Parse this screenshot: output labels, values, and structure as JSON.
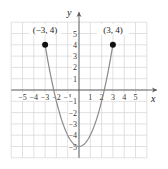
{
  "chart_data": {
    "type": "line",
    "title": "",
    "xlabel": "x",
    "ylabel": "y",
    "xlim": [
      -6,
      6
    ],
    "ylim": [
      -6,
      6
    ],
    "grid": true,
    "x_ticks": [
      -5,
      -4,
      -3,
      -2,
      -1,
      1,
      2,
      3,
      4,
      5
    ],
    "y_ticks": [
      -5,
      -4,
      -3,
      -2,
      -1,
      1,
      2,
      3,
      4,
      5
    ],
    "series": [
      {
        "name": "y = x^2 - 5",
        "x": [
          -3,
          -2.5,
          -2,
          -1.5,
          -1,
          -0.5,
          0,
          0.5,
          1,
          1.5,
          2,
          2.5,
          3
        ],
        "y": [
          4,
          1.25,
          -1,
          -2.75,
          -4,
          -4.75,
          -5,
          -4.75,
          -4,
          -2.75,
          -1,
          1.25,
          4
        ],
        "color": "#8a8a8a"
      }
    ],
    "points": [
      {
        "x": -3,
        "y": 4,
        "label": "(−3, 4)"
      },
      {
        "x": 3,
        "y": 4,
        "label": "(3, 4)"
      }
    ]
  },
  "colors": {
    "grid": "#d4d4d4",
    "axis": "#555555",
    "curve": "#8a8a8a",
    "point": "#111111"
  }
}
